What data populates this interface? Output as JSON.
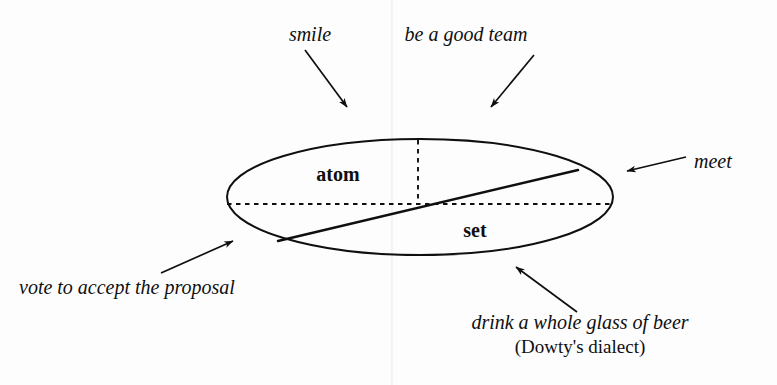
{
  "figure": {
    "type": "aspectual-class-ellipse-diagram",
    "background_color": "#fdfdfd",
    "ink_color": "#100f0f"
  },
  "inner_labels": {
    "atom": "atom",
    "set": "set"
  },
  "callouts": {
    "smile": "smile",
    "team": "be a good team",
    "meet": "meet",
    "vote": "vote to accept the proposal",
    "drink": "drink a whole glass of beer",
    "dowty": "(Dowty's dialect)"
  },
  "geometry": {
    "ellipse": {
      "cx": 420,
      "cy": 197,
      "rx": 193,
      "ry": 58
    },
    "diagonal": {
      "x1": 278,
      "y1": 241,
      "x2": 578,
      "y2": 170
    },
    "dashed_horizontal": {
      "x1": 227,
      "y1": 204,
      "x2": 612,
      "y2": 204
    },
    "dashed_vertical": {
      "x1": 418,
      "y1": 140,
      "x2": 418,
      "y2": 204
    }
  },
  "arrows": {
    "smile": {
      "x1": 305,
      "y1": 50,
      "x2": 347,
      "y2": 107
    },
    "team": {
      "x1": 534,
      "y1": 55,
      "x2": 491,
      "y2": 107
    },
    "meet": {
      "x1": 686,
      "y1": 157,
      "x2": 627,
      "y2": 171
    },
    "vote": {
      "x1": 161,
      "y1": 273,
      "x2": 233,
      "y2": 241
    },
    "drink": {
      "x1": 577,
      "y1": 312,
      "x2": 516,
      "y2": 267
    }
  }
}
